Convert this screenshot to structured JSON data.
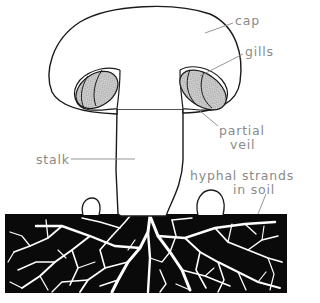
{
  "diagram": {
    "colors": {
      "outline": "#1a1a1a",
      "soil": "#0a0a0a",
      "hyphae": "#ffffff",
      "label_text": "#8a8a8a",
      "leader_line": "#8a8a8a",
      "gill_stipple": "#7a7a7a"
    },
    "labels": {
      "cap": "cap",
      "gills": "gills",
      "partial_veil_1": "partial",
      "partial_veil_2": "veil",
      "stalk": "stalk",
      "hyphal_1": "hyphal strands",
      "hyphal_2": "in soil"
    }
  }
}
